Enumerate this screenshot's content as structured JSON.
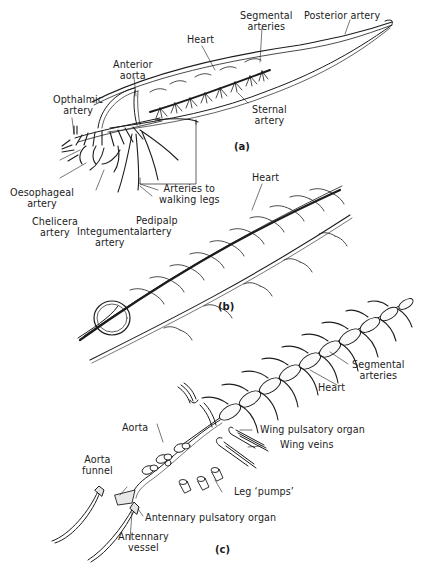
{
  "figure": {
    "panels": [
      {
        "id": "a",
        "tag": "(a)",
        "labels": {
          "heart": "Heart",
          "segmental_arteries": [
            "Segmental",
            "arteries"
          ],
          "posterior_artery": "Posterior artery",
          "anterior_aorta": [
            "Anterior",
            "aorta"
          ],
          "opthalmic_artery": [
            "Opthalmic",
            "artery"
          ],
          "sternal_artery": [
            "Sternal",
            "artery"
          ],
          "oesophageal_artery": [
            "Oesophageal",
            "artery"
          ],
          "arteries_to_walking_legs": [
            "Arteries to",
            "walking legs"
          ],
          "chelicera_artery": [
            "Chelicera",
            "artery"
          ],
          "pedipalp_artery": [
            "Pedipalp",
            "artery"
          ],
          "integumental_artery": [
            "Integumental",
            "artery"
          ]
        }
      },
      {
        "id": "b",
        "tag": "(b)",
        "labels": {
          "heart": "Heart"
        }
      },
      {
        "id": "c",
        "tag": "(c)",
        "labels": {
          "segmental_arteries": [
            "Segmental",
            "arteries"
          ],
          "heart": "Heart",
          "aorta": "Aorta",
          "wing_pulsatory_organ": "Wing pulsatory organ",
          "wing_veins": "Wing veins",
          "aorta_funnel": [
            "Aorta",
            "funnel"
          ],
          "leg_pumps": "Leg ‘pumps’",
          "antennary_pulsatory_organ": "Antennary pulsatory organ",
          "antennary_vessel": [
            "Antennary",
            "vessel"
          ]
        }
      }
    ],
    "colors": {
      "ink": "#1c1c1c",
      "background": "#ffffff"
    }
  }
}
